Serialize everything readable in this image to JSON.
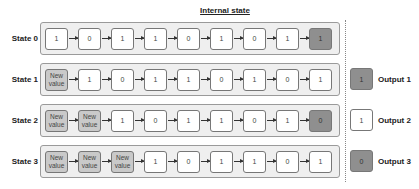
{
  "title": "Internal state",
  "colors": {
    "container_bg": "#efefef",
    "container_border": "#9a9a9a",
    "cell_bg": "#ffffff",
    "new_value_bg": "#c9c9c9",
    "output_bg": "#8f8f8f"
  },
  "states": [
    {
      "label": "State 0",
      "cells": [
        "1",
        "0",
        "1",
        "1",
        "0",
        "1",
        "0",
        "1",
        "1"
      ],
      "new_count": 0,
      "output_last": true
    },
    {
      "label": "State 1",
      "cells": [
        "New value",
        "1",
        "0",
        "1",
        "1",
        "0",
        "1",
        "0",
        "1"
      ],
      "new_count": 1,
      "output_last": false
    },
    {
      "label": "State 2",
      "cells": [
        "New value",
        "New value",
        "1",
        "0",
        "1",
        "1",
        "0",
        "1",
        "0"
      ],
      "new_count": 2,
      "output_last": true
    },
    {
      "label": "State 3",
      "cells": [
        "New value",
        "New value",
        "New value",
        "1",
        "0",
        "1",
        "1",
        "0",
        "1"
      ],
      "new_count": 3,
      "output_last": false
    }
  ],
  "outputs": [
    {
      "value": "1",
      "label": "Output 1",
      "style": "dark"
    },
    {
      "value": "1",
      "label": "Output 2",
      "style": "light"
    },
    {
      "value": "0",
      "label": "Output 3",
      "style": "dark"
    }
  ]
}
